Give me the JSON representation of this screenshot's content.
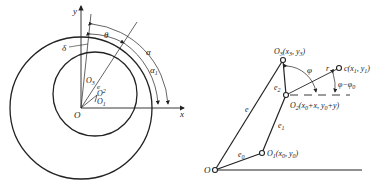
{
  "left_figure": {
    "axis_labels": {
      "x": "x",
      "y": "y"
    },
    "origin": "O",
    "points": {
      "o1": "O",
      "o1_sub": "1",
      "o2": "O",
      "o2_sub": "2",
      "o3": "O",
      "o3_sub": "3"
    },
    "labels": {
      "eccentricity": "e",
      "delta": "δ",
      "theta": "θ",
      "alpha": "α",
      "alpha1": "α",
      "alpha1_sub": "1"
    }
  },
  "right_figure": {
    "origin": "O",
    "o1": {
      "name": "O",
      "sub": "1",
      "coords": "(x",
      "coords_sub": "0",
      "coords_mid": ", y",
      "coords_sub2": "0",
      "coords_end": ")"
    },
    "o2": {
      "name": "O",
      "sub": "2",
      "coords_a": "(x",
      "sub_a": "0",
      "coords_b": "+x, y",
      "sub_b": "0",
      "coords_c": "+y)"
    },
    "o3": {
      "name": "O",
      "sub": "3",
      "coords_a": "(x",
      "sub_a": "3",
      "coords_b": ", y",
      "sub_b": "3",
      "coords_c": ")"
    },
    "c": {
      "name": "c",
      "coords_a": "(x",
      "sub_a": "1",
      "coords_b": ", y",
      "sub_b": "1",
      "coords_c": ")"
    },
    "links": {
      "e": "e",
      "e0": "e",
      "e0_sub": "0",
      "e1": "e",
      "e1_sub": "1",
      "e2": "e",
      "e2_sub": "2",
      "r": "r"
    },
    "angles": {
      "phi": "φ",
      "phi_diff": "φ−φ",
      "phi_diff_sub": "0"
    }
  }
}
